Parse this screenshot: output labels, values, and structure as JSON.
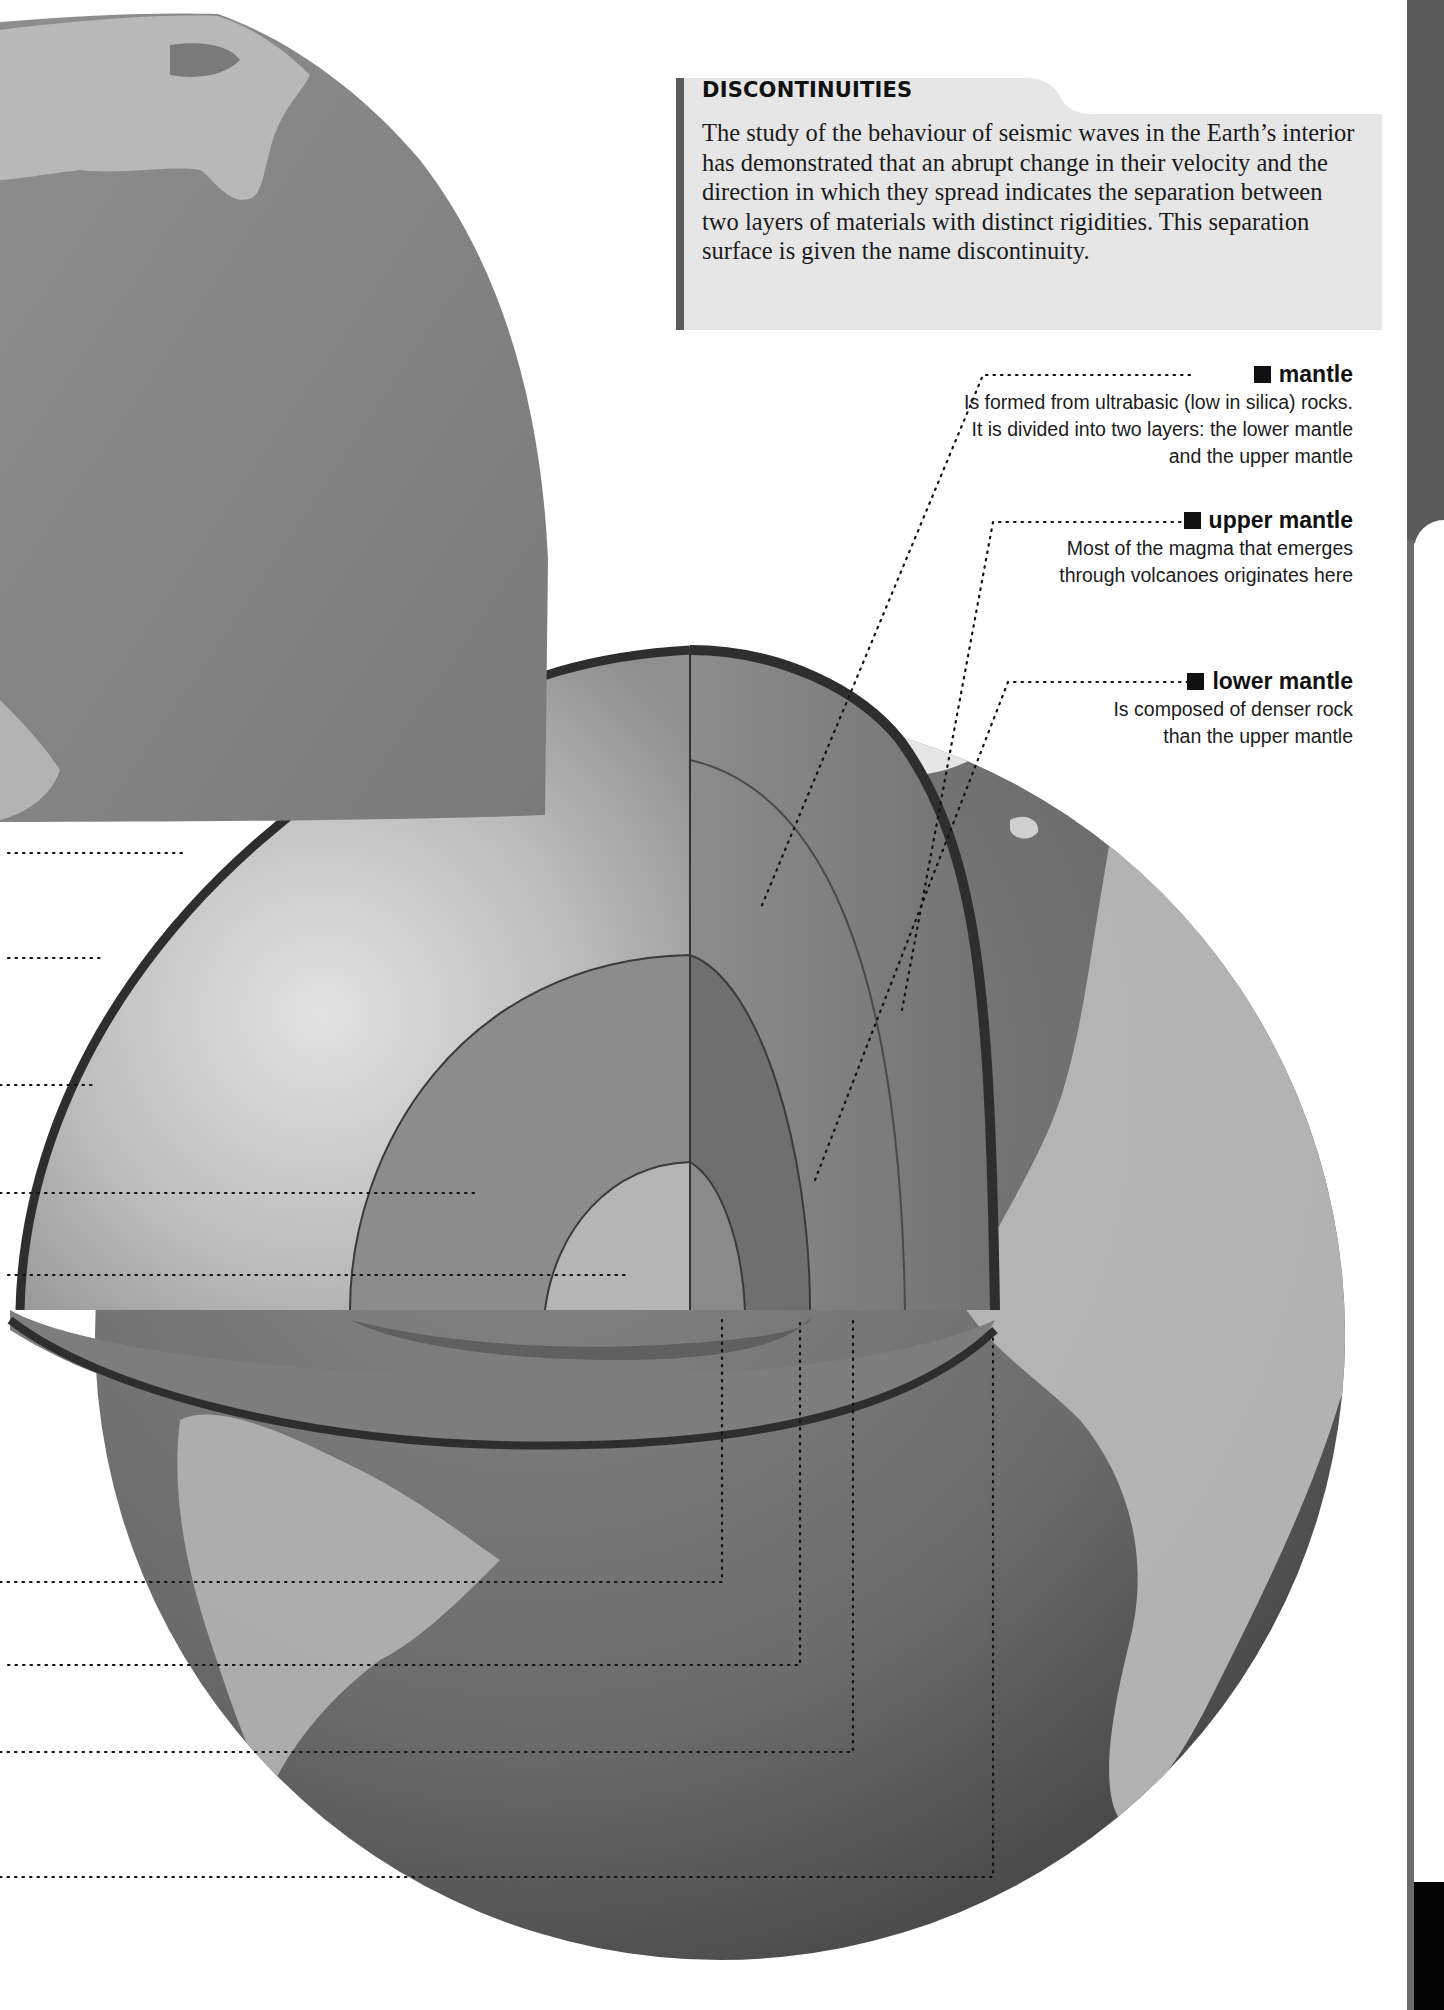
{
  "infobox": {
    "title": "DISCONTINUITIES",
    "body": "The study of the behaviour of seismic waves in the Earth’s interior has demonstrated that an abrupt change in their velocity and the direction in which they spread indicates the separation between two layers of materials with distinct rigidities. This separation surface is given the name discontinuity."
  },
  "callouts": [
    {
      "title": "mantle",
      "description": "Is formed from ultrabasic (low in silica) rocks. It is divided into two layers: the lower mantle and the upper mantle"
    },
    {
      "title": "upper mantle",
      "description": "Most of the magma that emerges through volcanoes originates here"
    },
    {
      "title": "lower mantle",
      "description": "Is composed of denser rock than the upper mantle"
    }
  ],
  "illustration": {
    "subject": "Earth cutaway globe showing internal layers",
    "layers_visible": [
      "crust",
      "upper mantle",
      "lower mantle",
      "outer core",
      "inner core"
    ],
    "left_leader_lines_count": 9,
    "colors": {
      "ocean": "#6f6f6f",
      "land": "#bdbdbd",
      "mantle_light": "#c9c9c9",
      "outer_core": "#8a8a8a",
      "inner_core": "#b4b4b4",
      "shell_edge": "#2e2e2e",
      "infobox_bg": "#e6e6e6",
      "infobox_bar": "#5a5a5a",
      "side_tab": "#5b5b5b"
    }
  }
}
